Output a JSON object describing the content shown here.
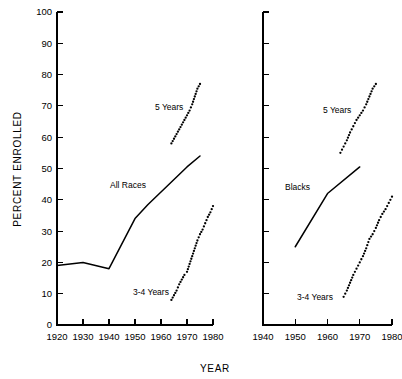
{
  "figure": {
    "ylabel": "PERCENT ENROLLED",
    "xlabel": "YEAR",
    "ytick_labels": [
      "0",
      "10",
      "20",
      "30",
      "40",
      "50",
      "60",
      "70",
      "80",
      "90",
      "100"
    ],
    "ytick_values": [
      0,
      10,
      20,
      30,
      40,
      50,
      60,
      70,
      80,
      90,
      100
    ]
  },
  "panels": {
    "left": {
      "name": "all-races-panel",
      "xtick_labels": [
        "1920",
        "1930",
        "1940",
        "1950",
        "1960",
        "1970",
        "1980"
      ],
      "xtick_values": [
        1920,
        1930,
        1940,
        1950,
        1960,
        1970,
        1980
      ],
      "labels": {
        "main": "All Races",
        "five_years": "5 Years",
        "three_four_years": "3-4 Years"
      }
    },
    "right": {
      "name": "blacks-panel",
      "xtick_labels": [
        "1940",
        "1950",
        "1960",
        "1970",
        "1980"
      ],
      "xtick_values": [
        1940,
        1950,
        1960,
        1970,
        1980
      ],
      "labels": {
        "main": "Blacks",
        "five_years": "5 Years",
        "three_four_years": "3-4 Years"
      }
    }
  },
  "chart_data": [
    {
      "type": "line",
      "panel": "left",
      "title": "All Races",
      "xlabel": "YEAR",
      "ylabel": "PERCENT ENROLLED",
      "xlim": [
        1920,
        1980
      ],
      "ylim": [
        0,
        100
      ],
      "grid": false,
      "legend": "inline-annotations",
      "series": [
        {
          "name": "All Races",
          "style": "solid",
          "x": [
            1920,
            1930,
            1940,
            1950,
            1955,
            1960,
            1965,
            1970,
            1975
          ],
          "values": [
            19.0,
            20.0,
            18.0,
            34.0,
            38.5,
            42.5,
            46.5,
            50.5,
            54.0
          ]
        },
        {
          "name": "5 Years",
          "style": "dotted",
          "x": [
            1964,
            1965,
            1966,
            1967,
            1968,
            1969,
            1970,
            1971,
            1972,
            1973,
            1974,
            1975
          ],
          "values": [
            58.0,
            59.5,
            61.0,
            62.5,
            64.0,
            65.5,
            67.0,
            68.5,
            70.5,
            73.0,
            75.5,
            77.0
          ]
        },
        {
          "name": "3-4 Years",
          "style": "dotted",
          "x": [
            1964,
            1965,
            1966,
            1967,
            1968,
            1969,
            1970,
            1971,
            1972,
            1973,
            1974,
            1975,
            1976,
            1977,
            1978,
            1979,
            1980
          ],
          "values": [
            8.0,
            9.5,
            11.0,
            13.0,
            14.5,
            16.0,
            17.0,
            19.5,
            22.0,
            24.5,
            27.0,
            29.0,
            30.5,
            32.5,
            34.5,
            36.0,
            38.0
          ]
        }
      ]
    },
    {
      "type": "line",
      "panel": "right",
      "title": "Blacks",
      "xlabel": "YEAR",
      "ylabel": "PERCENT ENROLLED",
      "xlim": [
        1940,
        1980
      ],
      "ylim": [
        0,
        100
      ],
      "grid": false,
      "legend": "inline-annotations",
      "series": [
        {
          "name": "Blacks",
          "style": "solid",
          "x": [
            1950,
            1960,
            1970
          ],
          "values": [
            25.0,
            42.0,
            50.5
          ]
        },
        {
          "name": "5 Years",
          "style": "dotted",
          "x": [
            1964,
            1965,
            1966,
            1967,
            1968,
            1969,
            1970,
            1971,
            1972,
            1973,
            1974,
            1975
          ],
          "values": [
            55.0,
            57.0,
            59.0,
            61.5,
            63.5,
            65.5,
            67.0,
            68.5,
            70.5,
            73.0,
            75.5,
            77.0
          ]
        },
        {
          "name": "3-4 Years",
          "style": "dotted",
          "x": [
            1965,
            1966,
            1967,
            1968,
            1969,
            1970,
            1971,
            1972,
            1973,
            1974,
            1975,
            1976,
            1977,
            1978,
            1979,
            1980
          ],
          "values": [
            9.0,
            11.0,
            13.5,
            16.0,
            18.0,
            20.0,
            22.0,
            24.5,
            27.5,
            29.0,
            31.0,
            33.5,
            35.5,
            37.0,
            39.0,
            41.0
          ]
        }
      ]
    }
  ]
}
